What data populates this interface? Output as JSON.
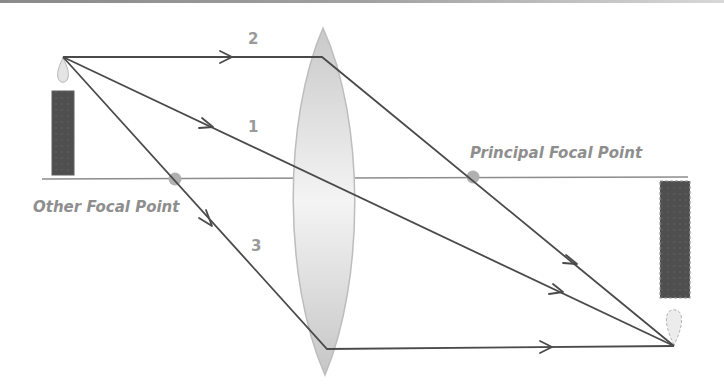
{
  "colors": {
    "ray": "#4a4a4a",
    "axis": "#8c8c8c",
    "label": "#8e8e8e",
    "candle": "#4f4f4f",
    "focal_point": "#b0b0b0",
    "lens": "#d4d4d4"
  },
  "labels": {
    "principal_focal_point": "Principal Focal Point",
    "other_focal_point": "Other Focal Point",
    "ray_1": "1",
    "ray_2": "2",
    "ray_3": "3"
  },
  "elements": {
    "object": "candle (upright)",
    "image": "candle (inverted, real)",
    "lens": "converging (biconvex) lens"
  }
}
